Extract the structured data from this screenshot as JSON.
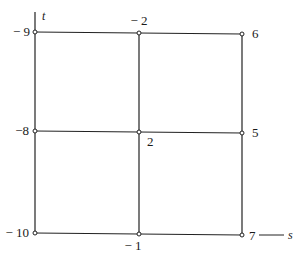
{
  "diagram": {
    "type": "grid-graph",
    "axes": {
      "vertical": {
        "label": "t"
      },
      "horizontal": {
        "label": "s"
      }
    },
    "nodes": [
      {
        "id": "n00",
        "row": 0,
        "col": 0,
        "value": "− 9"
      },
      {
        "id": "n01",
        "row": 0,
        "col": 1,
        "value": "− 2"
      },
      {
        "id": "n02",
        "row": 0,
        "col": 2,
        "value": "6"
      },
      {
        "id": "n10",
        "row": 1,
        "col": 0,
        "value": "−8"
      },
      {
        "id": "n11",
        "row": 1,
        "col": 1,
        "value": "2"
      },
      {
        "id": "n12",
        "row": 1,
        "col": 2,
        "value": "5"
      },
      {
        "id": "n20",
        "row": 2,
        "col": 0,
        "value": "− 10"
      },
      {
        "id": "n21",
        "row": 2,
        "col": 1,
        "value": "− 1"
      },
      {
        "id": "n22",
        "row": 2,
        "col": 2,
        "value": "7"
      }
    ],
    "line_color": "#222222",
    "node_fill": "#ffffff"
  }
}
